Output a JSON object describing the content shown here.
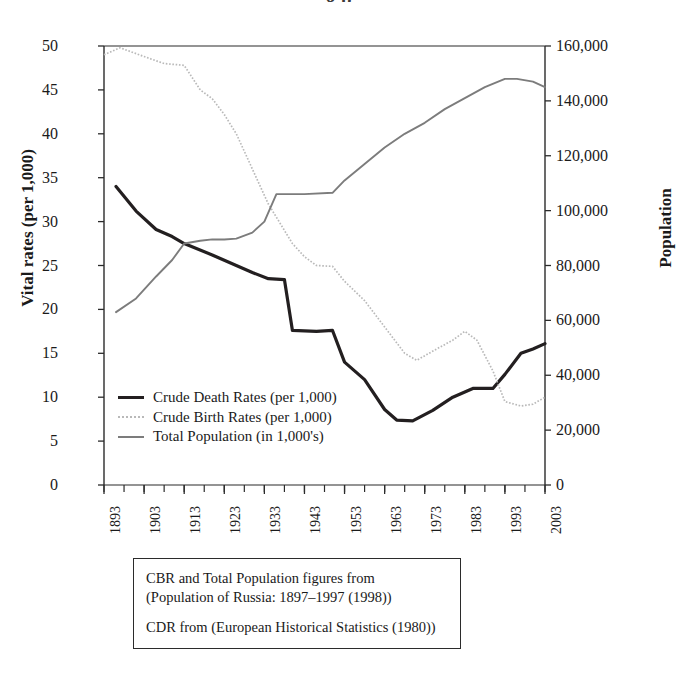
{
  "figure": {
    "clipped_title_fragment": "g p",
    "left_axis_title": "Vital rates (per 1,000)",
    "right_axis_title": "Population"
  },
  "legend": {
    "items": [
      {
        "label": "Crude Death Rates (per 1,000)",
        "key": "cdr",
        "color": "#231f20"
      },
      {
        "label": "Crude Birth Rates (per 1,000)",
        "key": "cbr",
        "color": "#b9b9b9"
      },
      {
        "label": "Total Population (in 1,000's)",
        "key": "pop",
        "color": "#7c7c7c"
      }
    ]
  },
  "source_box": {
    "line1": "CBR and Total Population figures from",
    "line2": "(Population of Russia: 1897–1997 (1998))",
    "line3": "CDR from (European Historical Statistics (1980))"
  },
  "chart_data": {
    "type": "line",
    "title": "",
    "xlabel": "",
    "ylabel": "Vital rates (per 1,000)",
    "y2label": "Population",
    "xlim": [
      1893,
      2003
    ],
    "ylim": [
      0,
      50
    ],
    "y2lim": [
      0,
      160000
    ],
    "grid": false,
    "legend_position": "inside-lower-left",
    "xticks": [
      1893,
      1903,
      1913,
      1923,
      1933,
      1943,
      1953,
      1963,
      1973,
      1983,
      1993,
      2003
    ],
    "xminor_step": 5,
    "yticks": [
      0,
      5,
      10,
      15,
      20,
      25,
      30,
      35,
      40,
      45,
      50
    ],
    "y2ticks": [
      0,
      20000,
      40000,
      60000,
      80000,
      100000,
      120000,
      140000,
      160000
    ],
    "y2ticklabels": [
      "0",
      "20,000",
      "40,000",
      "60,000",
      "80,000",
      "100,000",
      "120,000",
      "140,000",
      "160,000"
    ],
    "series": [
      {
        "name": "Crude Death Rates (per 1,000)",
        "axis": "left",
        "color": "#231f20",
        "style": "solid-thick",
        "points": [
          [
            1896,
            34.0
          ],
          [
            1901,
            31.2
          ],
          [
            1906,
            29.1
          ],
          [
            1910,
            28.3
          ],
          [
            1913,
            27.5
          ],
          [
            1920,
            26.2
          ],
          [
            1926,
            25.0
          ],
          [
            1930,
            24.2
          ],
          [
            1934,
            23.5
          ],
          [
            1938,
            23.4
          ],
          [
            1940,
            17.6
          ],
          [
            1946,
            17.5
          ],
          [
            1950,
            17.6
          ],
          [
            1953,
            14.0
          ],
          [
            1958,
            12.0
          ],
          [
            1963,
            8.6
          ],
          [
            1966,
            7.4
          ],
          [
            1970,
            7.3
          ],
          [
            1975,
            8.5
          ],
          [
            1980,
            10.0
          ],
          [
            1985,
            11.0
          ],
          [
            1990,
            11.0
          ],
          [
            1993,
            12.6
          ],
          [
            1997,
            15.0
          ],
          [
            2000,
            15.5
          ],
          [
            2003,
            16.1
          ]
        ]
      },
      {
        "name": "Crude Birth Rates (per 1,000)",
        "axis": "left",
        "color": "#b9b9b9",
        "style": "dotted-thin",
        "points": [
          [
            1893,
            49.0
          ],
          [
            1897,
            49.8
          ],
          [
            1903,
            48.8
          ],
          [
            1908,
            48.0
          ],
          [
            1913,
            47.8
          ],
          [
            1917,
            45.0
          ],
          [
            1920,
            44.0
          ],
          [
            1923,
            42.2
          ],
          [
            1926,
            40.0
          ],
          [
            1930,
            36.0
          ],
          [
            1934,
            32.0
          ],
          [
            1938,
            29.0
          ],
          [
            1940,
            27.5
          ],
          [
            1943,
            26.0
          ],
          [
            1946,
            25.0
          ],
          [
            1950,
            24.9
          ],
          [
            1953,
            23.2
          ],
          [
            1958,
            21.0
          ],
          [
            1963,
            18.0
          ],
          [
            1968,
            15.0
          ],
          [
            1971,
            14.2
          ],
          [
            1976,
            15.5
          ],
          [
            1980,
            16.5
          ],
          [
            1983,
            17.5
          ],
          [
            1986,
            16.5
          ],
          [
            1990,
            13.0
          ],
          [
            1993,
            9.5
          ],
          [
            1997,
            9.0
          ],
          [
            2000,
            9.2
          ],
          [
            2003,
            10.0
          ]
        ]
      },
      {
        "name": "Total Population (in 1,000's)",
        "axis": "right",
        "color": "#7c7c7c",
        "style": "solid-medium",
        "points": [
          [
            1896,
            63000
          ],
          [
            1901,
            68000
          ],
          [
            1906,
            76000
          ],
          [
            1910,
            82000
          ],
          [
            1913,
            88000
          ],
          [
            1917,
            89000
          ],
          [
            1920,
            89500
          ],
          [
            1923,
            89500
          ],
          [
            1926,
            89800
          ],
          [
            1930,
            92000
          ],
          [
            1933,
            96000
          ],
          [
            1936,
            106000
          ],
          [
            1943,
            106000
          ],
          [
            1950,
            106500
          ],
          [
            1953,
            111000
          ],
          [
            1958,
            117000
          ],
          [
            1963,
            123000
          ],
          [
            1968,
            128000
          ],
          [
            1973,
            132000
          ],
          [
            1978,
            137000
          ],
          [
            1983,
            141000
          ],
          [
            1988,
            145000
          ],
          [
            1993,
            148000
          ],
          [
            1996,
            148000
          ],
          [
            2000,
            147000
          ],
          [
            2003,
            145000
          ]
        ]
      }
    ]
  }
}
